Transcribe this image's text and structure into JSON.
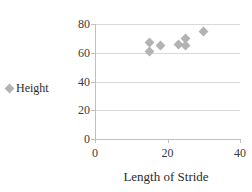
{
  "chart_data": {
    "type": "scatter",
    "title": "",
    "xlabel": "Length of Stride",
    "ylabel": "",
    "xlim": [
      0,
      40
    ],
    "ylim": [
      0,
      80
    ],
    "xticks": [
      0,
      20,
      40
    ],
    "yticks": [
      0,
      20,
      40,
      60,
      80
    ],
    "xtick_labels": [
      "0",
      "20",
      "40"
    ],
    "ytick_labels": [
      "0",
      "20",
      "40",
      "60",
      "80"
    ],
    "grid": "horizontal",
    "legend_position": "left",
    "series": [
      {
        "name": "Height",
        "marker": "diamond",
        "color": "#b3b3b3",
        "points": [
          {
            "x": 15,
            "y": 67
          },
          {
            "x": 15,
            "y": 61
          },
          {
            "x": 18,
            "y": 65
          },
          {
            "x": 23,
            "y": 66
          },
          {
            "x": 25,
            "y": 70
          },
          {
            "x": 25,
            "y": 65
          },
          {
            "x": 30,
            "y": 75
          }
        ]
      }
    ]
  },
  "legend": {
    "label": "Height",
    "marker_name": "diamond-marker"
  },
  "colors": {
    "marker": "#b3b3b3",
    "gridline": "#d9d9d9",
    "axis": "#bfbfbf",
    "text": "#2b2b2b",
    "background": "#ffffff"
  }
}
